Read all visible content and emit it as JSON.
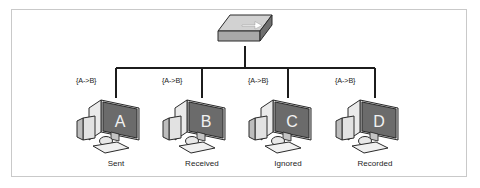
{
  "diagram": {
    "background_color": "#ffffff",
    "frame_color": "#c9c9c9",
    "line_color": "#1c1c1c"
  },
  "switch": {
    "label": "network-switch",
    "top_face_color": "#d4d4d4",
    "front_face_color": "#9e9e9e",
    "side_face_color": "#6e6e6e",
    "arrow_color": "#ffffff"
  },
  "nodes": [
    {
      "id": "A",
      "screen_letter": "A",
      "packet_label": "{A->B}",
      "caption": "Sent",
      "screen_color": "#6b6b6b"
    },
    {
      "id": "B",
      "screen_letter": "B",
      "packet_label": "{A->B}",
      "caption": "Received",
      "screen_color": "#6b6b6b"
    },
    {
      "id": "C",
      "screen_letter": "C",
      "packet_label": "{A->B}",
      "caption": "Ignored",
      "screen_color": "#6b6b6b"
    },
    {
      "id": "D",
      "screen_letter": "D",
      "packet_label": "{A->B}",
      "caption": "Recorded",
      "screen_color": "#6b6b6b"
    }
  ]
}
